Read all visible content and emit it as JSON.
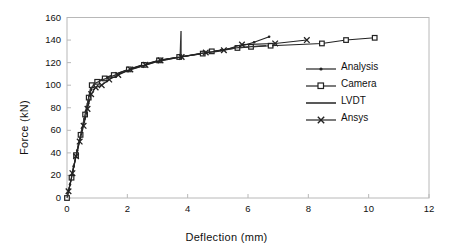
{
  "chart_data": {
    "type": "line",
    "title": "",
    "xlabel": "Deflection  (mm)",
    "ylabel": "Force (kN)",
    "xlim": [
      0,
      12
    ],
    "ylim": [
      0,
      160
    ],
    "xticks": [
      0,
      2,
      4,
      6,
      8,
      10,
      12
    ],
    "yticks": [
      0,
      20,
      40,
      60,
      80,
      100,
      120,
      140,
      160
    ],
    "grid": false,
    "legend_position": "center-right",
    "legend": [
      "Analysis",
      "Camera",
      "LVDT",
      "Ansys"
    ],
    "series": [
      {
        "name": "Analysis",
        "marker": "dot",
        "color": "#222222",
        "points": [
          [
            0.0,
            0
          ],
          [
            0.1,
            12
          ],
          [
            0.22,
            28
          ],
          [
            0.34,
            42
          ],
          [
            0.46,
            56
          ],
          [
            0.58,
            70
          ],
          [
            0.7,
            84
          ],
          [
            0.8,
            96
          ],
          [
            0.9,
            101
          ],
          [
            1.05,
            104
          ],
          [
            1.3,
            107
          ],
          [
            1.6,
            110
          ],
          [
            2.05,
            114
          ],
          [
            2.5,
            118
          ],
          [
            3.05,
            122
          ],
          [
            3.7,
            125
          ],
          [
            4.5,
            128
          ],
          [
            5.1,
            131
          ],
          [
            5.7,
            134
          ],
          [
            6.2,
            138
          ],
          [
            6.7,
            143
          ]
        ]
      },
      {
        "name": "Camera",
        "marker": "square",
        "color": "#222222",
        "points": [
          [
            0.0,
            0
          ],
          [
            0.15,
            18
          ],
          [
            0.3,
            38
          ],
          [
            0.45,
            56
          ],
          [
            0.6,
            74
          ],
          [
            0.72,
            89
          ],
          [
            0.82,
            100
          ],
          [
            1.0,
            103
          ],
          [
            1.25,
            106
          ],
          [
            1.55,
            109
          ],
          [
            2.05,
            114
          ],
          [
            2.55,
            118
          ],
          [
            3.05,
            122
          ],
          [
            3.72,
            125
          ],
          [
            4.5,
            128
          ],
          [
            4.8,
            130
          ],
          [
            5.65,
            133
          ],
          [
            6.1,
            134
          ],
          [
            6.75,
            135
          ],
          [
            8.45,
            137
          ],
          [
            9.25,
            140
          ],
          [
            10.2,
            142
          ]
        ]
      },
      {
        "name": "LVDT",
        "marker": "none",
        "color": "#333333",
        "points": [
          [
            0.0,
            0
          ],
          [
            0.12,
            14
          ],
          [
            0.25,
            31
          ],
          [
            0.4,
            50
          ],
          [
            0.55,
            68
          ],
          [
            0.68,
            84
          ],
          [
            0.78,
            97
          ],
          [
            0.95,
            102
          ],
          [
            1.2,
            105
          ],
          [
            1.5,
            108
          ],
          [
            2.0,
            113
          ],
          [
            2.5,
            117
          ],
          [
            3.0,
            121
          ],
          [
            3.75,
            125
          ],
          [
            3.78,
            148
          ],
          [
            3.78,
            125
          ],
          [
            4.4,
            128
          ],
          [
            5.0,
            130
          ],
          [
            5.6,
            133
          ],
          [
            6.0,
            134
          ],
          [
            6.6,
            135
          ]
        ]
      },
      {
        "name": "Ansys",
        "marker": "x",
        "color": "#222222",
        "points": [
          [
            0.05,
            6
          ],
          [
            0.18,
            22
          ],
          [
            0.3,
            37
          ],
          [
            0.42,
            50
          ],
          [
            0.55,
            64
          ],
          [
            0.68,
            79
          ],
          [
            0.8,
            92
          ],
          [
            0.95,
            98
          ],
          [
            1.15,
            100
          ],
          [
            1.4,
            105
          ],
          [
            1.7,
            109
          ],
          [
            2.1,
            114
          ],
          [
            2.6,
            118
          ],
          [
            3.1,
            122
          ],
          [
            3.8,
            125
          ],
          [
            4.6,
            129
          ],
          [
            5.2,
            131
          ],
          [
            5.8,
            136
          ],
          [
            6.9,
            137
          ],
          [
            7.95,
            140
          ]
        ]
      }
    ]
  },
  "axes": {
    "x_tick_labels": [
      "0",
      "2",
      "4",
      "6",
      "8",
      "10",
      "12"
    ],
    "y_tick_labels": [
      "0",
      "20",
      "40",
      "60",
      "80",
      "100",
      "120",
      "140",
      "160"
    ],
    "x_title": "Deflection  (mm)",
    "y_title": "Force (kN)"
  },
  "legend": {
    "items": [
      {
        "label": "Analysis",
        "marker": "dot"
      },
      {
        "label": "Camera",
        "marker": "square"
      },
      {
        "label": "LVDT",
        "marker": "none"
      },
      {
        "label": "Ansys",
        "marker": "x"
      }
    ]
  },
  "colors": {
    "line": "#222222",
    "axis": "#b8b8b8",
    "text": "#111111",
    "background": "#ffffff"
  }
}
